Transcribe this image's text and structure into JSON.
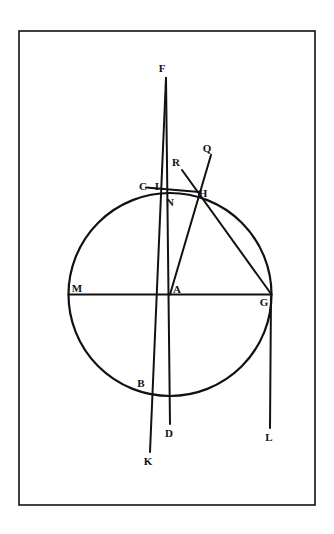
{
  "figure": {
    "background_color": "#ffffff",
    "ink_color": "#111111",
    "border": {
      "name": "plate-border",
      "x": 19,
      "y": 31,
      "width": 296,
      "height": 474,
      "stroke_width": 1.6
    },
    "circle": {
      "name": "main-circle",
      "center_x": 170,
      "center_y": 294.5,
      "radius": 101.5,
      "stroke_width": 2.2
    },
    "points": [
      {
        "id": "F",
        "label": "F",
        "x": 166.0,
        "y": 78.0,
        "label_x": 162.0,
        "label_y": 72.0
      },
      {
        "id": "Q",
        "label": "Q",
        "x": 211.0,
        "y": 155.0,
        "label_x": 207.0,
        "label_y": 152.0
      },
      {
        "id": "R",
        "label": "R",
        "x": 182.0,
        "y": 170.0,
        "label_x": 176.0,
        "label_y": 166.0
      },
      {
        "id": "C",
        "label": "C",
        "x": 152.5,
        "y": 186.5,
        "label_x": 143.0,
        "label_y": 190.0
      },
      {
        "id": "I",
        "label": "I",
        "x": 166.5,
        "y": 184.5,
        "label_x": 157.0,
        "label_y": 190.0
      },
      {
        "id": "H",
        "label": "H",
        "x": 196.5,
        "y": 191.5,
        "label_x": 200.0,
        "label_y": 196.0
      },
      {
        "id": "N",
        "label": "N",
        "x": 171.0,
        "y": 193.5,
        "label_x": 167.0,
        "label_y": 205.0
      },
      {
        "id": "M",
        "label": "M",
        "x": 68.5,
        "y": 294.5,
        "label_x": 73.0,
        "label_y": 292.0
      },
      {
        "id": "A",
        "label": "A",
        "x": 170.0,
        "y": 294.5,
        "label_x": 174.0,
        "label_y": 293.0
      },
      {
        "id": "G",
        "label": "G",
        "x": 271.5,
        "y": 294.5,
        "label_x": 261.0,
        "label_y": 305.0
      },
      {
        "id": "B",
        "label": "B",
        "x": 151.0,
        "y": 388.0,
        "label_x": 139.0,
        "label_y": 387.0
      },
      {
        "id": "D",
        "label": "D",
        "x": 170.0,
        "y": 424.0,
        "label_x": 166.0,
        "label_y": 436.0
      },
      {
        "id": "L",
        "label": "L",
        "x": 270.0,
        "y": 428.0,
        "label_x": 265.0,
        "label_y": 440.0
      },
      {
        "id": "K",
        "label": "K",
        "x": 150.0,
        "y": 452.0,
        "label_x": 145.0,
        "label_y": 464.0
      }
    ],
    "segments": [
      {
        "name": "segment-F-to-K",
        "from": "F",
        "to": "K",
        "x1": 166.0,
        "y1": 78.0,
        "x2": 150.0,
        "y2": 452.0,
        "stroke_width": 2.0
      },
      {
        "name": "segment-F-to-D",
        "from": "F",
        "to": "D",
        "x1": 166.0,
        "y1": 78.0,
        "x2": 170.0,
        "y2": 424.0,
        "stroke_width": 2.0
      },
      {
        "name": "segment-M-to-G-diameter",
        "from": "M",
        "to": "G",
        "x1": 68.5,
        "y1": 294.5,
        "x2": 271.5,
        "y2": 294.5,
        "stroke_width": 2.0
      },
      {
        "name": "segment-G-to-L",
        "from": "G",
        "to": "L",
        "x1": 271.0,
        "y1": 294.5,
        "x2": 270.0,
        "y2": 428.0,
        "stroke_width": 2.0
      },
      {
        "name": "segment-A-to-Q",
        "from": "A",
        "to": "Q",
        "x1": 170.0,
        "y1": 294.5,
        "x2": 211.0,
        "y2": 155.0,
        "stroke_width": 2.0
      },
      {
        "name": "segment-R-to-G",
        "from": "R",
        "to": "G",
        "x1": 182.0,
        "y1": 170.0,
        "x2": 271.5,
        "y2": 294.5,
        "stroke_width": 2.0
      },
      {
        "name": "segment-C-to-H",
        "from": "C",
        "to": "H",
        "x1": 146.0,
        "y1": 187.5,
        "x2": 199.5,
        "y2": 192.0,
        "stroke_width": 2.0
      }
    ],
    "labels_legend": [
      "F",
      "Q",
      "R",
      "C",
      "I",
      "H",
      "N",
      "M",
      "A",
      "G",
      "B",
      "D",
      "L",
      "K"
    ]
  }
}
